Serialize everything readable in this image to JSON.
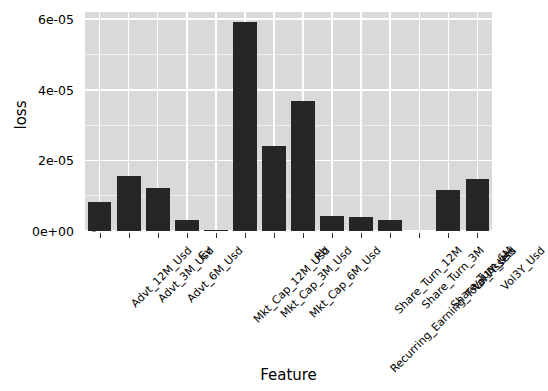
{
  "chart_data": {
    "type": "bar",
    "title": "",
    "xlabel": "Feature",
    "ylabel": "loss",
    "grid": true,
    "legend": null,
    "ylim": [
      0,
      6.2e-05
    ],
    "ytick_values": [
      0,
      2e-05,
      4e-05,
      6e-05
    ],
    "ytick_labels": [
      "0e+00",
      "2e-05",
      "4e-05",
      "6e-05"
    ],
    "bar_color": "#262626",
    "panel_color": "#d9d9d9",
    "gridline_color": "#ffffff",
    "categories": [
      "Advt_12M_Usd",
      "Advt_3M_Usd",
      "Advt_6M_Usd",
      "Ev",
      "Mkt_Cap_12M_Usd",
      "Mkt_Cap_3M_Usd",
      "Mkt_Cap_6M_Usd",
      "Pb",
      "Recurring_Earning_Total_Assets",
      "Share_Turn_12M",
      "Share_Turn_3M",
      "Share_Turn_6M",
      "Vol1Y_Usd",
      "Vol3Y_Usd"
    ],
    "values": [
      8.2e-06,
      1.55e-05,
      1.22e-05,
      3.2e-06,
      4e-07,
      5.92e-05,
      2.4e-05,
      3.68e-05,
      4.2e-06,
      4.1e-06,
      3.2e-06,
      0.0,
      1.15e-05,
      1.48e-05
    ]
  }
}
